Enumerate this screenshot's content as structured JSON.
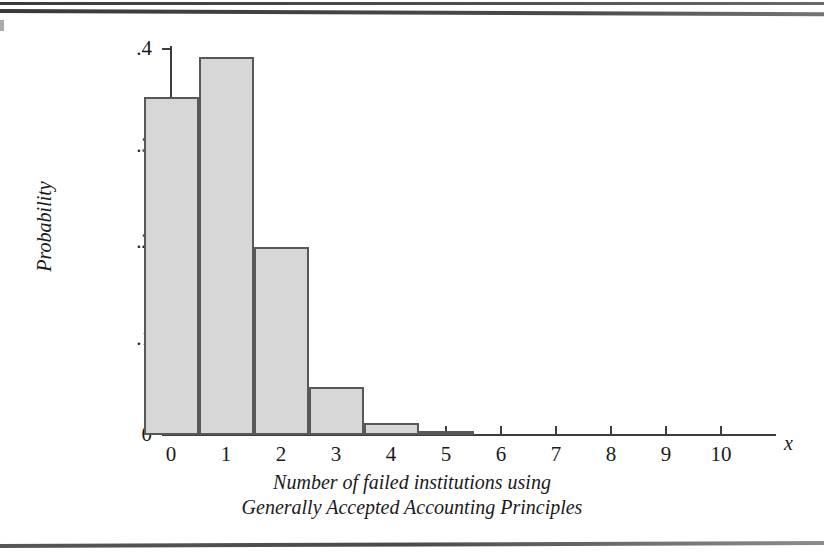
{
  "figure": {
    "caption_line1": "Number of failed institutions using",
    "caption_line2": "Generally Accepted Accounting Principles"
  },
  "chart_data": {
    "type": "bar",
    "title": "",
    "subtitle": "",
    "xlabel": "Number of failed institutions using Generally Accepted Accounting Principles",
    "ylabel": "Probability",
    "x_axis_variable": "x",
    "categories": [
      "0",
      "1",
      "2",
      "3",
      "4",
      "5",
      "6",
      "7",
      "8",
      "9",
      "10"
    ],
    "x": [
      0,
      1,
      2,
      3,
      4,
      5,
      6,
      7,
      8,
      9,
      10
    ],
    "values": [
      0.35,
      0.392,
      0.195,
      0.05,
      0.0125,
      0.004,
      0,
      0,
      0,
      0,
      0
    ],
    "bar_width": 1,
    "xlim": [
      -0.5,
      11.0
    ],
    "ylim": [
      0,
      0.4
    ],
    "yticks": [
      0,
      0.1,
      0.2,
      0.3,
      0.4
    ],
    "ytick_labels": [
      "0",
      ".1",
      ".2",
      ".3",
      ".4"
    ],
    "xticks": [
      0,
      1,
      2,
      3,
      4,
      5,
      6,
      7,
      8,
      9,
      10
    ],
    "xtick_labels": [
      "0",
      "1",
      "2",
      "3",
      "4",
      "5",
      "6",
      "7",
      "8",
      "9",
      "10"
    ],
    "grid": false,
    "legend": false,
    "bar_fill_color": "#d7d7d7",
    "bar_edge_color": "#585858",
    "axis_color": "#3d3d3d"
  }
}
